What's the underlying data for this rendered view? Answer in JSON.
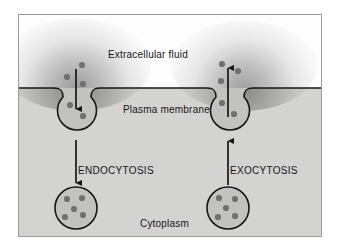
{
  "figure": {
    "title_visible": false,
    "background_color": "#ffffff",
    "frame_border_color": "#9a9a9a"
  },
  "regions": {
    "extracellular": {
      "label": "Extracellular fluid",
      "fill_color": "#fdfdfd"
    },
    "membrane": {
      "label": "Plasma membrane",
      "line_color": "#161616"
    },
    "cytoplasm": {
      "label": "Cytoplasm",
      "fill_color": "#d3d3d1"
    }
  },
  "processes": {
    "endocytosis": {
      "label": "ENDOCYTOSIS",
      "direction": "inward",
      "arrow_glyph": "down-arrow"
    },
    "exocytosis": {
      "label": "EXOCYTOSIS",
      "direction": "outward",
      "arrow_glyph": "up-arrow"
    }
  },
  "elements": {
    "vesicle_fill_color": "#c2c2c0",
    "vesicle_stroke_color": "#161616",
    "particle_color": "#707070",
    "counts": {
      "endocytosis_particles_outside": 3,
      "endocytosis_particles_inside_pocket": 2,
      "exocytosis_particles_outside": 3,
      "exocytosis_particles_inside_pocket": 2,
      "cytoplasm_vesicle_left_particles": 5,
      "cytoplasm_vesicle_right_particles": 5
    }
  }
}
